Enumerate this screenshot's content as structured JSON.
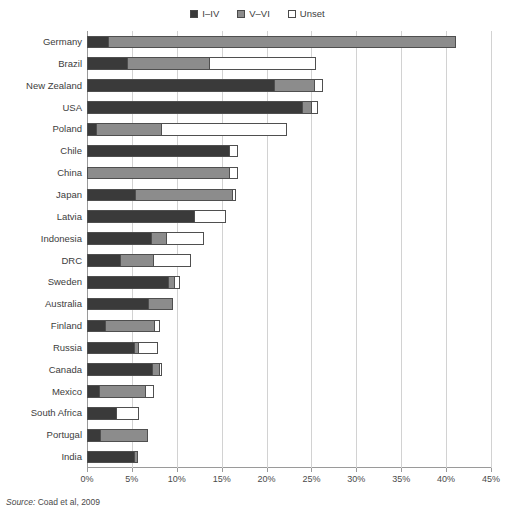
{
  "legend": {
    "position": "top-center",
    "items": [
      {
        "label": "I–IV",
        "color": "#3a3a3a",
        "name": "series-i-iv"
      },
      {
        "label": "V–VI",
        "color": "#8c8c8c",
        "name": "series-v-vi"
      },
      {
        "label": "Unset",
        "color": "#ffffff",
        "name": "series-unset"
      }
    ]
  },
  "source": {
    "prefix": "Source:",
    "text": " Coad et al, 2009"
  },
  "chart_data": {
    "type": "bar",
    "orientation": "horizontal",
    "stacked": true,
    "title": "",
    "subtitle": "",
    "xlabel": "",
    "ylabel": "",
    "xlim": [
      0,
      45
    ],
    "xticks": [
      0,
      5,
      10,
      15,
      20,
      25,
      30,
      35,
      40,
      45
    ],
    "xticklabels": [
      "0%",
      "5%",
      "10%",
      "15%",
      "20%",
      "25%",
      "30%",
      "35%",
      "40%",
      "45%"
    ],
    "grid": true,
    "grid_axis": "x",
    "legend_position": "top-center",
    "unit": "percent",
    "categories": [
      "Germany",
      "Brazil",
      "New Zealand",
      "USA",
      "Poland",
      "Chile",
      "China",
      "Japan",
      "Latvia",
      "Indonesia",
      "DRC",
      "Sweden",
      "Australia",
      "Finland",
      "Russia",
      "Canada",
      "Mexico",
      "South Africa",
      "Portugal",
      "India"
    ],
    "series": [
      {
        "name": "I–IV",
        "color": "#3a3a3a",
        "values": [
          2.3,
          4.4,
          20.8,
          24.0,
          1.0,
          15.8,
          0.0,
          5.3,
          11.9,
          7.1,
          3.7,
          9.0,
          6.8,
          2.0,
          5.2,
          7.2,
          1.3,
          3.2,
          1.4,
          5.2
        ]
      },
      {
        "name": "V–VI",
        "color": "#8c8c8c",
        "values": [
          38.7,
          9.2,
          4.5,
          1.0,
          7.2,
          0.0,
          15.8,
          10.9,
          0.0,
          1.7,
          3.7,
          0.7,
          2.7,
          5.5,
          0.5,
          0.8,
          5.2,
          0.0,
          5.3,
          0.4
        ]
      },
      {
        "name": "Unset",
        "color": "#ffffff",
        "values": [
          0.0,
          11.8,
          0.9,
          0.6,
          14.0,
          0.9,
          0.9,
          0.3,
          3.5,
          4.1,
          4.1,
          0.6,
          0.0,
          0.5,
          2.1,
          0.2,
          0.9,
          2.5,
          0.0,
          0.0
        ]
      }
    ],
    "totals": [
      41.0,
      25.4,
      26.2,
      25.6,
      22.2,
      16.7,
      16.7,
      16.5,
      15.4,
      12.9,
      11.5,
      10.3,
      9.5,
      8.0,
      7.8,
      8.2,
      7.4,
      5.7,
      6.7,
      5.6
    ]
  }
}
